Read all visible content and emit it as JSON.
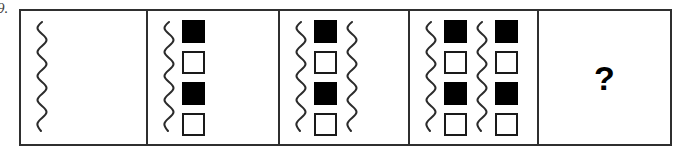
{
  "item": {
    "number_label": "9."
  },
  "puzzle": {
    "type": "figural-sequence-matrix",
    "panel_count": 5,
    "panels": [
      {
        "name": "panel-1",
        "index": 1,
        "elements": [
          {
            "kind": "squiggle"
          }
        ]
      },
      {
        "name": "panel-2",
        "index": 2,
        "elements": [
          {
            "kind": "squiggle"
          },
          {
            "kind": "square-column",
            "squares": [
              "filled",
              "empty",
              "filled",
              "empty"
            ]
          }
        ]
      },
      {
        "name": "panel-3",
        "index": 3,
        "elements": [
          {
            "kind": "squiggle"
          },
          {
            "kind": "square-column",
            "squares": [
              "filled",
              "empty",
              "filled",
              "empty"
            ]
          },
          {
            "kind": "squiggle"
          }
        ]
      },
      {
        "name": "panel-4",
        "index": 4,
        "elements": [
          {
            "kind": "squiggle"
          },
          {
            "kind": "square-column",
            "squares": [
              "filled",
              "empty",
              "filled",
              "empty"
            ]
          },
          {
            "kind": "squiggle"
          },
          {
            "kind": "square-column",
            "squares": [
              "filled",
              "empty",
              "filled",
              "empty"
            ]
          }
        ]
      },
      {
        "name": "panel-5",
        "index": 5,
        "elements": [
          {
            "kind": "question-mark",
            "label": "?"
          }
        ]
      }
    ]
  },
  "colors": {
    "frame": "#2f2f2f",
    "square_outline": "#1a1a1a",
    "square_fill": "#000000",
    "squiggle": "#2b2b2b",
    "background": "#ffffff",
    "item_number": "#3a3a3a"
  }
}
